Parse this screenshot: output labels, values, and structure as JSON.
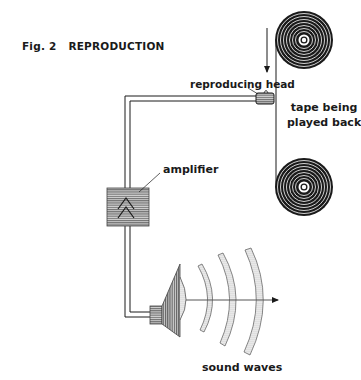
{
  "figure": {
    "number": "Fig. 2",
    "title": "REPRODUCTION"
  },
  "labels": {
    "reproducing_head": "reproducing head",
    "tape_line1": "tape being",
    "tape_line2": "played back",
    "amplifier": "amplifier",
    "sound_waves": "sound waves"
  },
  "components": [
    {
      "id": "supply-reel",
      "kind": "reel"
    },
    {
      "id": "take-up-reel",
      "kind": "reel"
    },
    {
      "id": "tape",
      "kind": "tape-path",
      "direction": "down"
    },
    {
      "id": "reproducing-head",
      "kind": "head"
    },
    {
      "id": "signal-wire",
      "kind": "double-line"
    },
    {
      "id": "amplifier",
      "kind": "box",
      "symbol": "double-chevron-up"
    },
    {
      "id": "loudspeaker",
      "kind": "speaker"
    },
    {
      "id": "sound-waves",
      "kind": "arcs",
      "count": 4
    }
  ],
  "colors": {
    "ink": "#1a1a1a",
    "fill_gray": "#8c8c8c",
    "dot_gray": "#b0b0b0"
  }
}
